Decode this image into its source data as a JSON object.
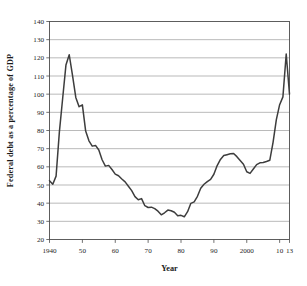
{
  "chart_data": {
    "type": "line",
    "title": "",
    "xlabel": "Year",
    "ylabel": "Federal debt as a percentage of GDP",
    "xlim": [
      1940,
      2013
    ],
    "ylim": [
      20,
      140
    ],
    "grid": true,
    "legend": false,
    "y_ticks": [
      20,
      30,
      40,
      50,
      60,
      70,
      80,
      90,
      100,
      110,
      120,
      130,
      140
    ],
    "y_tick_labels": [
      "20",
      "30",
      "40",
      "50",
      "60",
      "70",
      "80",
      "90",
      "100",
      "110",
      "120",
      "130",
      "140"
    ],
    "x_ticks": [
      1940,
      1950,
      1960,
      1970,
      1980,
      1990,
      2000,
      2010,
      2013
    ],
    "x_tick_labels": [
      "1940",
      "50",
      "60",
      "70",
      "80",
      "90",
      "2000",
      "10",
      "13"
    ],
    "series": [
      {
        "name": "Federal debt as a percentage of GDP",
        "color": "#3d3d3d",
        "x": [
          1940,
          1941,
          1942,
          1943,
          1944,
          1945,
          1946,
          1947,
          1948,
          1949,
          1950,
          1951,
          1952,
          1953,
          1954,
          1955,
          1956,
          1957,
          1958,
          1959,
          1960,
          1961,
          1962,
          1963,
          1964,
          1965,
          1966,
          1967,
          1968,
          1969,
          1970,
          1971,
          1972,
          1973,
          1974,
          1975,
          1976,
          1977,
          1978,
          1979,
          1980,
          1981,
          1982,
          1983,
          1984,
          1985,
          1986,
          1987,
          1988,
          1989,
          1990,
          1991,
          1992,
          1993,
          1994,
          1995,
          1996,
          1997,
          1998,
          1999,
          2000,
          2001,
          2002,
          2003,
          2004,
          2005,
          2006,
          2007,
          2008,
          2009,
          2010,
          2011,
          2012,
          2013
        ],
        "y": [
          52.4,
          50.4,
          54.9,
          79.1,
          97.6,
          116.0,
          121.7,
          110.3,
          98.2,
          93.1,
          94.1,
          79.7,
          74.3,
          71.4,
          71.8,
          69.3,
          63.9,
          60.4,
          60.8,
          58.5,
          56.0,
          55.1,
          53.3,
          51.7,
          49.3,
          46.9,
          43.6,
          41.9,
          42.5,
          38.6,
          37.6,
          37.8,
          37.0,
          35.6,
          33.6,
          34.7,
          36.2,
          35.8,
          35.0,
          33.1,
          33.3,
          32.5,
          35.3,
          39.9,
          40.7,
          43.8,
          48.2,
          50.4,
          51.9,
          53.1,
          55.9,
          60.7,
          64.1,
          66.2,
          66.7,
          67.2,
          67.3,
          65.6,
          63.5,
          61.4,
          57.3,
          56.4,
          58.8,
          61.2,
          62.2,
          62.4,
          62.9,
          63.6,
          73.5,
          86.0,
          94.2,
          98.5,
          122.1,
          100.0
        ]
      }
    ]
  },
  "axis": {
    "y_label_text": "Federal debt as a percentage of GDP",
    "x_label_text": "Year"
  }
}
